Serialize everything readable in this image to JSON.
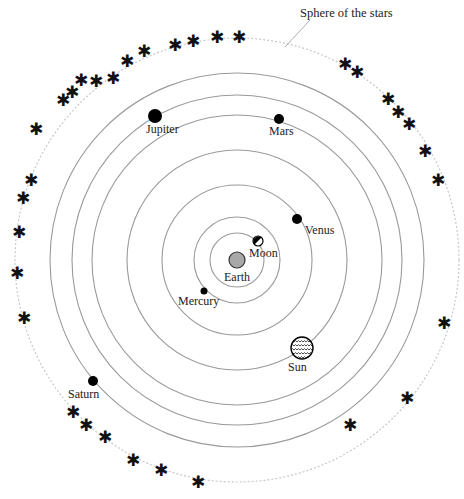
{
  "diagram": {
    "title": "Sphere of the stars",
    "center": [
      237,
      260
    ],
    "colors": {
      "orbit": "#9a9a9a",
      "sphere": "#c8c8c8",
      "planet": "#000000",
      "earth": "#a8a8a8"
    },
    "orbits": [
      27,
      43,
      75,
      110,
      145,
      165,
      187
    ],
    "sphere_radius": 222,
    "bodies": [
      {
        "name": "Earth",
        "label": "Earth",
        "x": 237,
        "y": 260,
        "r": 8,
        "lx": 224,
        "ly": 281,
        "type": "earth"
      },
      {
        "name": "Moon",
        "label": "Moon",
        "x": 258,
        "y": 241,
        "r": 5,
        "lx": 249,
        "ly": 257,
        "type": "moon"
      },
      {
        "name": "Mercury",
        "label": "Mercury",
        "x": 204,
        "y": 291,
        "r": 3.5,
        "lx": 178,
        "ly": 305,
        "type": "planet"
      },
      {
        "name": "Venus",
        "label": "Venus",
        "x": 297,
        "y": 219,
        "r": 5,
        "lx": 305,
        "ly": 234,
        "type": "planet"
      },
      {
        "name": "Sun",
        "label": "Sun",
        "x": 302,
        "y": 348,
        "r": 11,
        "lx": 288,
        "ly": 371,
        "type": "sun"
      },
      {
        "name": "Mars",
        "label": "Mars",
        "x": 279,
        "y": 119,
        "r": 5,
        "lx": 269,
        "ly": 135,
        "type": "planet"
      },
      {
        "name": "Jupiter",
        "label": "Jupiter",
        "x": 155,
        "y": 116,
        "r": 7,
        "lx": 146,
        "ly": 133,
        "type": "planet"
      },
      {
        "name": "Saturn",
        "label": "Saturn",
        "x": 93,
        "y": 381,
        "r": 5,
        "lx": 68,
        "ly": 398,
        "type": "planet"
      }
    ],
    "stars": [
      [
        175,
        45
      ],
      [
        193,
        41
      ],
      [
        217,
        37
      ],
      [
        239,
        37
      ],
      [
        345,
        64
      ],
      [
        357,
        72
      ],
      [
        388,
        99
      ],
      [
        398,
        112
      ],
      [
        409,
        124
      ],
      [
        425,
        151
      ],
      [
        438,
        180
      ],
      [
        144,
        51
      ],
      [
        127,
        61
      ],
      [
        113,
        78
      ],
      [
        96,
        81
      ],
      [
        81,
        80
      ],
      [
        72,
        92
      ],
      [
        63,
        100
      ],
      [
        36,
        129
      ],
      [
        31,
        180
      ],
      [
        23,
        198
      ],
      [
        19,
        232
      ],
      [
        17,
        273
      ],
      [
        24,
        318
      ],
      [
        444,
        323
      ],
      [
        407,
        398
      ],
      [
        350,
        425
      ],
      [
        73,
        412
      ],
      [
        86,
        425
      ],
      [
        105,
        437
      ],
      [
        133,
        460
      ],
      [
        161,
        470
      ],
      [
        198,
        482
      ]
    ]
  }
}
